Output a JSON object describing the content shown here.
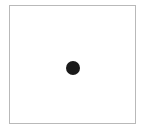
{
  "page": {
    "background_color": "#ffffff",
    "width": 146,
    "height": 132
  },
  "panel": {
    "name": "plot-panel",
    "background_color": "#ffffff",
    "border_color": "#b9b9b9",
    "border_width_px": 1,
    "x": 9,
    "y": 5,
    "width": 127,
    "height": 119,
    "label": ""
  },
  "chart_data": {
    "type": "scatter",
    "title": "",
    "subtitle": "",
    "xlabel": "",
    "ylabel": "",
    "grid": false,
    "legend": null,
    "axis_ticks": {
      "x": [],
      "y": []
    },
    "xlim": [
      0,
      1
    ],
    "ylim": [
      0,
      1
    ],
    "series": [
      {
        "name": "point",
        "marker": "circle",
        "color": "#1a1a1a",
        "marker_size_px": 14,
        "points": [
          {
            "x": 0.504,
            "y": 0.529,
            "px": 73,
            "py": 68,
            "label": ""
          }
        ]
      }
    ]
  },
  "marker": {
    "name": "data-point-dot",
    "color": "#1a1a1a",
    "diameter_px": 14,
    "center_x_px": 73,
    "center_y_px": 68,
    "label": ""
  }
}
